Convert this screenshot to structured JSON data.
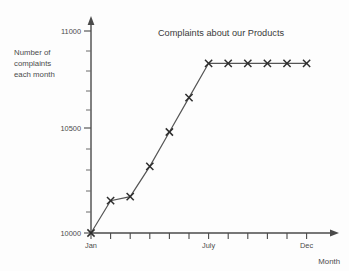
{
  "chart_data": {
    "type": "line",
    "title": "Complaints about our Products",
    "xlabel": "Month",
    "ylabel": "Number of complaints each month",
    "ylabel_lines": [
      "Number of",
      "complaints",
      "each month"
    ],
    "categories": [
      "Jan",
      "Feb",
      "Mar",
      "Apr",
      "May",
      "Jun",
      "July",
      "Aug",
      "Sep",
      "Oct",
      "Nov",
      "Dec"
    ],
    "values": [
      10000,
      10160,
      10180,
      10330,
      10500,
      10670,
      10840,
      10840,
      10840,
      10840,
      10840,
      10840
    ],
    "x_tick_labels_shown": [
      "Jan",
      "July",
      "Dec"
    ],
    "x_tick_label_indices": [
      0,
      6,
      11
    ],
    "y_tick_labels": [
      "11000",
      "10500",
      "10000"
    ],
    "y_tick_values": [
      11000,
      10500,
      10000
    ],
    "y_minor_ticks": [
      10100,
      10200,
      10300,
      10400,
      10600,
      10700,
      10800,
      10900
    ],
    "ylim": [
      10000,
      11050
    ],
    "grid": false,
    "legend": false,
    "marker": "x",
    "line_color": "#555555",
    "marker_color": "#2e2e2e",
    "axis_color": "#4a4a4a",
    "background": "#fdfdfd"
  },
  "labels": {
    "title": "Complaints about our Products",
    "y_caption_line1": "Number of",
    "y_caption_line2": "complaints",
    "y_caption_line3": "each month",
    "x_caption": "Month",
    "y_tick_top": "11000",
    "y_tick_mid": "10500",
    "y_tick_bottom": "10000",
    "x_tick_first": "Jan",
    "x_tick_middle": "July",
    "x_tick_last": "Dec"
  }
}
